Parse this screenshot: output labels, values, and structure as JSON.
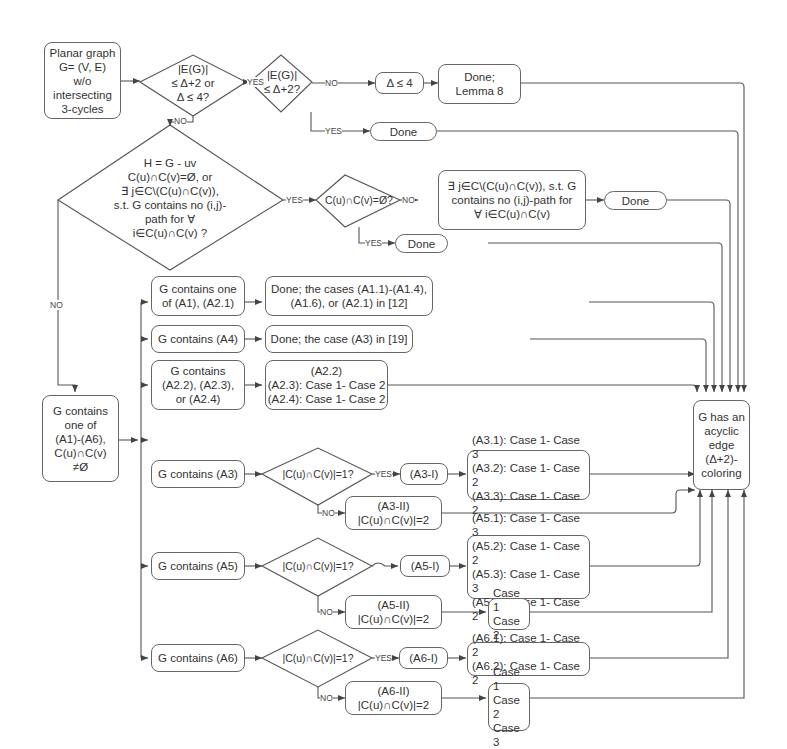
{
  "start": {
    "lines": [
      "Planar graph",
      "G= (V, E)",
      "w/o",
      "intersecting",
      "3-cycles"
    ]
  },
  "d1": {
    "lines": [
      "|E(G)|",
      "≤ Δ+2 or",
      "Δ ≤ 4?"
    ]
  },
  "d2": {
    "lines": [
      "|E(G)|",
      "≤ Δ+2?"
    ]
  },
  "delta4": {
    "text": "Δ ≤ 4"
  },
  "lemma8": {
    "lines": [
      "Done;",
      "Lemma 8"
    ]
  },
  "done1": {
    "text": "Done"
  },
  "d3": {
    "lines": [
      "H = G  -  uv",
      "C(u)∩C(v)=Ø,  or",
      "∃ j∈C\\(C(u)∩C(v)),",
      "s.t. G contains no (i,j)-",
      "path for ∀",
      "i∈C(u)∩C(v) ?"
    ]
  },
  "d4": {
    "text": "C(u)∩C(v)=Ø?"
  },
  "exists_box": {
    "lines": [
      "∃ j∈C\\(C(u)∩C(v)), s.t. G",
      "contains no (i,j)-path for",
      "∀ i∈C(u)∩C(v)"
    ]
  },
  "done2": {
    "text": "Done"
  },
  "done3": {
    "text": "Done"
  },
  "contains_any": {
    "lines": [
      "G contains",
      "one of",
      "(A1)-(A6),",
      "C(u)∩C(v)",
      "≠Ø"
    ]
  },
  "a1": {
    "lines": [
      "G contains one",
      "of (A1), (A2.1)"
    ]
  },
  "a1_done": {
    "lines": [
      "Done; the cases (A1.1)-(A1.4),",
      "(A1.6), or (A2.1)  in [12]"
    ]
  },
  "a4": {
    "text": "G contains (A4)"
  },
  "a4_done": {
    "text": "Done; the case (A3)  in [19]"
  },
  "a2": {
    "lines": [
      "G contains",
      "(A2.2), (A2.3),",
      "or (A2.4)"
    ]
  },
  "a2_cases": {
    "lines": [
      "(A2.2)",
      "(A2.3): Case 1- Case 2",
      "(A2.4): Case 1- Case 2"
    ]
  },
  "a3": {
    "text": "G contains (A3)"
  },
  "a3_diamond": {
    "text": "|C(u)∩C(v)|=1?"
  },
  "a3_i": {
    "text": "(A3-I)"
  },
  "a3_cases": {
    "lines": [
      "(A3.1): Case 1- Case 3",
      "(A3.2): Case 1- Case 2",
      "(A3.3): Case 1- Case 2"
    ]
  },
  "a3_ii": {
    "lines": [
      "(A3-II)",
      "|C(u)∩C(v)|=2"
    ]
  },
  "a5": {
    "text": "G contains (A5)"
  },
  "a5_diamond": {
    "text": "|C(u)∩C(v)|=1?"
  },
  "a5_i": {
    "text": "(A5-I)"
  },
  "a5_cases": {
    "lines": [
      "(A5.1): Case 1- Case 3",
      "(A5.2): Case 1- Case 2",
      "(A5.3): Case 1- Case 3",
      "(A5.4): Case 1- Case 2"
    ]
  },
  "a5_ii": {
    "lines": [
      "(A5-II)",
      "|C(u)∩C(v)|=2"
    ]
  },
  "a5_ii_cases": {
    "lines": [
      "Case 1",
      "Case 2"
    ]
  },
  "a6": {
    "text": "G contains (A6)"
  },
  "a6_diamond": {
    "text": "|C(u)∩C(v)|=1?"
  },
  "a6_i": {
    "text": "(A6-I)"
  },
  "a6_cases": {
    "lines": [
      "(A6.1): Case 1- Case 2",
      "(A6.2): Case 1- Case 2"
    ]
  },
  "a6_ii": {
    "lines": [
      "(A6-II)",
      "|C(u)∩C(v)|=2"
    ]
  },
  "a6_ii_cases": {
    "lines": [
      "Case 1",
      "Case 2",
      "Case 3"
    ]
  },
  "result": {
    "lines": [
      "G has an",
      "acyclic",
      "edge",
      "(Δ+2)-",
      "coloring"
    ]
  },
  "labels": {
    "yes": "YES",
    "no": "NO"
  },
  "colors": {
    "line": "#555555",
    "border": "#666666",
    "text": "#333333",
    "background": "#ffffff"
  }
}
